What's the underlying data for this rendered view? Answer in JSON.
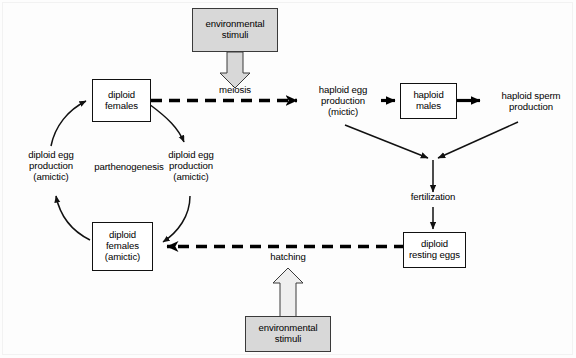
{
  "diagram": {
    "colors": {
      "stimulus_fill": "#d8d8d8",
      "box_fill": "#ffffff",
      "stroke": "#111111",
      "background": "#ffffff"
    },
    "boxes": [
      {
        "id": "env-top",
        "lines": [
          "environmental",
          "stimuli"
        ],
        "style": "stimulus"
      },
      {
        "id": "diploid-females",
        "lines": [
          "diploid",
          "females"
        ],
        "style": "box"
      },
      {
        "id": "haploid-males",
        "lines": [
          "haploid",
          "males"
        ],
        "style": "box"
      },
      {
        "id": "diploid-amictic",
        "lines": [
          "diploid",
          "females",
          "(amictic)"
        ],
        "style": "box"
      },
      {
        "id": "resting-eggs",
        "lines": [
          "diploid",
          "resting eggs"
        ],
        "style": "box"
      },
      {
        "id": "env-bottom",
        "lines": [
          "environmental",
          "stimuli"
        ],
        "style": "stimulus"
      }
    ],
    "labels": [
      {
        "id": "meiosis",
        "lines": [
          "meiosis"
        ]
      },
      {
        "id": "haploid-egg",
        "lines": [
          "haploid egg",
          "production",
          "(mictic)"
        ]
      },
      {
        "id": "haploid-sperm",
        "lines": [
          "haploid sperm",
          "production"
        ]
      },
      {
        "id": "fertilization",
        "lines": [
          "fertilization"
        ]
      },
      {
        "id": "hatching",
        "lines": [
          "hatching"
        ]
      },
      {
        "id": "parthenogenesis",
        "lines": [
          "parthenogenesis"
        ]
      },
      {
        "id": "diploid-egg-left",
        "lines": [
          "diploid egg",
          "production",
          "(amictic)"
        ]
      },
      {
        "id": "diploid-egg-right",
        "lines": [
          "diploid egg",
          "production",
          "(amictic)"
        ]
      }
    ],
    "connectors": [
      {
        "id": "env-top-to-meiosis",
        "kind": "block-arrow",
        "direction": "down"
      },
      {
        "id": "diploid-females-to-haploid-egg",
        "kind": "dashed-arrow",
        "direction": "right",
        "label": "meiosis"
      },
      {
        "id": "haploid-egg-to-males",
        "kind": "thick-arrow",
        "direction": "right"
      },
      {
        "id": "males-to-sperm",
        "kind": "thick-arrow",
        "direction": "right"
      },
      {
        "id": "haploid-egg-to-fertilization",
        "kind": "thin-arrow",
        "direction": "diagonal-down-right"
      },
      {
        "id": "sperm-to-fertilization",
        "kind": "thin-arrow",
        "direction": "diagonal-down-left"
      },
      {
        "id": "fertilization-to-resting-eggs",
        "kind": "thin-arrow",
        "direction": "down",
        "label": "fertilization"
      },
      {
        "id": "resting-eggs-to-amictic",
        "kind": "dashed-arrow",
        "direction": "left",
        "label": "hatching"
      },
      {
        "id": "env-bottom-to-hatching",
        "kind": "block-arrow",
        "direction": "up"
      },
      {
        "id": "diploid-females-to-egg-right",
        "kind": "curved-arrow",
        "direction": "down-right"
      },
      {
        "id": "egg-right-to-amictic",
        "kind": "curved-arrow",
        "direction": "down-left"
      },
      {
        "id": "amictic-to-egg-left",
        "kind": "curved-arrow",
        "direction": "up-left"
      },
      {
        "id": "egg-left-to-diploid-females",
        "kind": "curved-arrow",
        "direction": "up-right"
      }
    ]
  }
}
